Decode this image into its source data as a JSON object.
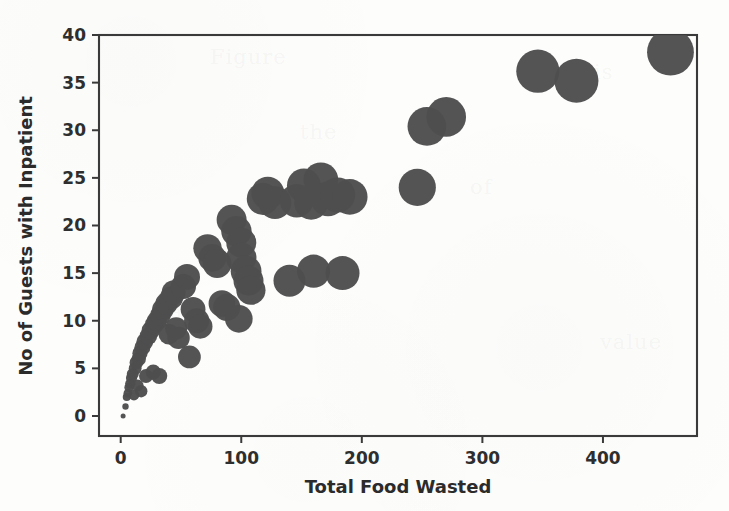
{
  "figure": {
    "background_color": "#fdfdfc",
    "bubble_color": "#4e4e50",
    "axis_color": "#3a3a3a"
  },
  "chart_data": {
    "type": "scatter",
    "title": "",
    "xlabel": "Total Food Wasted",
    "ylabel": "No of Guests with Inpatient",
    "xlim": [
      -18,
      478
    ],
    "ylim": [
      -2.1,
      40
    ],
    "xticks": [
      0,
      100,
      200,
      300,
      400
    ],
    "xtick_labels": [
      "0",
      "100",
      "200",
      "300",
      "400"
    ],
    "yticks": [
      0,
      5,
      10,
      15,
      20,
      25,
      30,
      35,
      40
    ],
    "ytick_labels": [
      "0",
      "5",
      "10",
      "15",
      "20",
      "25",
      "30",
      "35",
      "40"
    ],
    "grid": false,
    "legend": null,
    "marker": "circle",
    "size_encoding": "bubble area grows with value",
    "points": [
      {
        "x": 2,
        "y": 0,
        "r": 2.5
      },
      {
        "x": 4,
        "y": 1,
        "r": 3.2
      },
      {
        "x": 5,
        "y": 2,
        "r": 4.0
      },
      {
        "x": 6,
        "y": 2.4,
        "r": 4.4
      },
      {
        "x": 7,
        "y": 3,
        "r": 4.8
      },
      {
        "x": 8,
        "y": 3.4,
        "r": 5.2
      },
      {
        "x": 9,
        "y": 4,
        "r": 5.6
      },
      {
        "x": 10,
        "y": 4.4,
        "r": 6.0
      },
      {
        "x": 11,
        "y": 2.2,
        "r": 5.4
      },
      {
        "x": 12,
        "y": 5,
        "r": 6.4
      },
      {
        "x": 13,
        "y": 5.6,
        "r": 6.8
      },
      {
        "x": 14,
        "y": 3.2,
        "r": 6.0
      },
      {
        "x": 15,
        "y": 6,
        "r": 7.2
      },
      {
        "x": 16,
        "y": 6.6,
        "r": 7.6
      },
      {
        "x": 17,
        "y": 2.6,
        "r": 6.2
      },
      {
        "x": 18,
        "y": 7.2,
        "r": 8.0
      },
      {
        "x": 20,
        "y": 7.8,
        "r": 8.4
      },
      {
        "x": 21,
        "y": 4.2,
        "r": 7.0
      },
      {
        "x": 23,
        "y": 8.4,
        "r": 8.8
      },
      {
        "x": 25,
        "y": 9,
        "r": 9.2
      },
      {
        "x": 27,
        "y": 4.6,
        "r": 7.6
      },
      {
        "x": 28,
        "y": 9.6,
        "r": 9.6
      },
      {
        "x": 30,
        "y": 10,
        "r": 10.0
      },
      {
        "x": 32,
        "y": 4.2,
        "r": 8.0
      },
      {
        "x": 33,
        "y": 10.6,
        "r": 10.4
      },
      {
        "x": 35,
        "y": 11.2,
        "r": 10.8
      },
      {
        "x": 38,
        "y": 11.8,
        "r": 11.2
      },
      {
        "x": 40,
        "y": 8.6,
        "r": 10.4
      },
      {
        "x": 42,
        "y": 12.4,
        "r": 11.6
      },
      {
        "x": 44,
        "y": 13,
        "r": 12.0
      },
      {
        "x": 46,
        "y": 9.2,
        "r": 11.0
      },
      {
        "x": 48,
        "y": 8.2,
        "r": 11.2
      },
      {
        "x": 52,
        "y": 13.6,
        "r": 12.6
      },
      {
        "x": 55,
        "y": 14.6,
        "r": 13.0
      },
      {
        "x": 57,
        "y": 6.2,
        "r": 11.4
      },
      {
        "x": 60,
        "y": 11.2,
        "r": 12.4
      },
      {
        "x": 63,
        "y": 10,
        "r": 12.6
      },
      {
        "x": 66,
        "y": 9.4,
        "r": 12.2
      },
      {
        "x": 72,
        "y": 17.6,
        "r": 14.2
      },
      {
        "x": 76,
        "y": 16.6,
        "r": 14.0
      },
      {
        "x": 80,
        "y": 16,
        "r": 14.4
      },
      {
        "x": 84,
        "y": 11.8,
        "r": 13.4
      },
      {
        "x": 88,
        "y": 11.4,
        "r": 13.6
      },
      {
        "x": 92,
        "y": 20.6,
        "r": 15.0
      },
      {
        "x": 96,
        "y": 19.4,
        "r": 15.2
      },
      {
        "x": 98,
        "y": 10.2,
        "r": 13.8
      },
      {
        "x": 100,
        "y": 18.2,
        "r": 15.0
      },
      {
        "x": 100,
        "y": 16.6,
        "r": 15.2
      },
      {
        "x": 104,
        "y": 15.2,
        "r": 15.4
      },
      {
        "x": 106,
        "y": 14.2,
        "r": 15.0
      },
      {
        "x": 108,
        "y": 13.2,
        "r": 14.6
      },
      {
        "x": 118,
        "y": 22.8,
        "r": 16.2
      },
      {
        "x": 122,
        "y": 23.4,
        "r": 16.4
      },
      {
        "x": 128,
        "y": 22.4,
        "r": 16.4
      },
      {
        "x": 140,
        "y": 14.2,
        "r": 16.0
      },
      {
        "x": 146,
        "y": 22.6,
        "r": 16.8
      },
      {
        "x": 152,
        "y": 24.2,
        "r": 17.0
      },
      {
        "x": 158,
        "y": 22.4,
        "r": 17.0
      },
      {
        "x": 160,
        "y": 15.2,
        "r": 16.6
      },
      {
        "x": 166,
        "y": 24.8,
        "r": 17.4
      },
      {
        "x": 172,
        "y": 22.8,
        "r": 17.4
      },
      {
        "x": 180,
        "y": 23.2,
        "r": 17.6
      },
      {
        "x": 184,
        "y": 15.0,
        "r": 17.0
      },
      {
        "x": 190,
        "y": 23.0,
        "r": 17.8
      },
      {
        "x": 246,
        "y": 24.0,
        "r": 18.6
      },
      {
        "x": 254,
        "y": 30.4,
        "r": 19.4
      },
      {
        "x": 270,
        "y": 31.4,
        "r": 19.8
      },
      {
        "x": 346,
        "y": 36.2,
        "r": 21.6
      },
      {
        "x": 378,
        "y": 35.2,
        "r": 22.0
      },
      {
        "x": 456,
        "y": 38.2,
        "r": 23.4
      }
    ]
  },
  "ghost_marks": [
    {
      "text": "Figure",
      "x": 210,
      "y": 45
    },
    {
      "text": "the",
      "x": 300,
      "y": 120
    },
    {
      "text": "analysis",
      "x": 520,
      "y": 60
    },
    {
      "text": "of",
      "x": 470,
      "y": 175
    },
    {
      "text": "data",
      "x": 155,
      "y": 300
    },
    {
      "text": "value",
      "x": 600,
      "y": 330
    }
  ]
}
